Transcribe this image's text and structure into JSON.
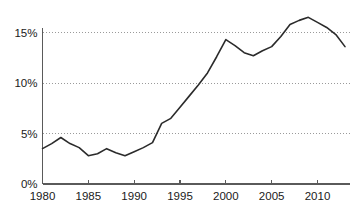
{
  "chart_data": {
    "type": "line",
    "title": "",
    "subtitle": "",
    "xlabel": "",
    "ylabel": "",
    "grid": "horizontal-dotted",
    "legend": "none",
    "xlim": [
      1980,
      2013
    ],
    "ylim": [
      0,
      17.5
    ],
    "y_tick_values": [
      0,
      5,
      10,
      15
    ],
    "y_tick_labels": [
      "0%",
      "5%",
      "10%",
      "15%"
    ],
    "x_tick_values": [
      1980,
      1985,
      1990,
      1995,
      2000,
      2005,
      2010
    ],
    "x_tick_labels": [
      "1980",
      "1985",
      "1990",
      "1995",
      "2000",
      "2005",
      "2010"
    ],
    "series": [
      {
        "name": "Share",
        "color": "#2b2b2b",
        "x": [
          1980,
          1981,
          1982,
          1983,
          1984,
          1985,
          1986,
          1987,
          1988,
          1989,
          1990,
          1991,
          1992,
          1993,
          1994,
          1995,
          1996,
          1997,
          1998,
          1999,
          2000,
          2001,
          2002,
          2003,
          2004,
          2005,
          2006,
          2007,
          2008,
          2009,
          2010,
          2011,
          2012,
          2013
        ],
        "values": [
          3.5,
          4.0,
          4.6,
          4.0,
          3.6,
          2.8,
          3.0,
          3.5,
          3.1,
          2.8,
          3.2,
          3.6,
          4.1,
          6.0,
          6.5,
          7.6,
          8.7,
          9.8,
          11.0,
          12.6,
          14.3,
          13.7,
          13.0,
          12.7,
          13.2,
          13.6,
          14.6,
          15.8,
          16.2,
          16.5,
          16.0,
          15.5,
          14.8,
          13.6
        ]
      }
    ]
  },
  "axis": {
    "y_axis_name": "percent-axis",
    "x_axis_name": "year-axis"
  }
}
